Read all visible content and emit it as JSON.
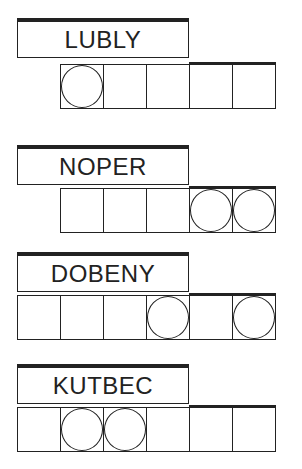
{
  "puzzles": [
    {
      "word": "LUBLY",
      "top": 18,
      "start_cell": 1,
      "cells": 5,
      "circled": [
        0
      ]
    },
    {
      "word": "NOPER",
      "top": 145,
      "start_cell": 1,
      "cells": 5,
      "circled": [
        3,
        4
      ]
    },
    {
      "word": "DOBENY",
      "top": 252,
      "start_cell": 0,
      "cells": 6,
      "circled": [
        3,
        5
      ]
    },
    {
      "word": "KUTBEC",
      "top": 364,
      "start_cell": 0,
      "cells": 6,
      "circled": [
        1,
        2
      ]
    }
  ],
  "colors": {
    "ink": "#222222",
    "background": "#ffffff"
  }
}
